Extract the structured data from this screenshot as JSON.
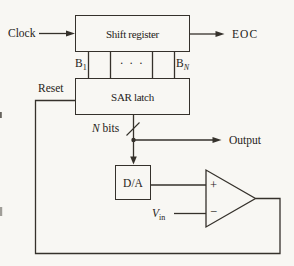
{
  "diagram": {
    "type": "block-diagram",
    "colors": {
      "paper": "#f8f7f3",
      "ink": "#35312b",
      "text": "#262319"
    },
    "blocks": {
      "shift_register": "Shift register",
      "sar_latch": "SAR latch",
      "dac": "D/A"
    },
    "labels": {
      "clock": "Clock",
      "eoc": "EOC",
      "reset": "Reset",
      "output": "Output",
      "dots": "· · ·",
      "b1_base": "B",
      "b1_sub": "1",
      "bn_base": "B",
      "bn_sub": "N",
      "nbits_n": "N",
      "nbits_rest": " bits",
      "vin_base": "V",
      "vin_sub": "in",
      "comparator_plus": "+",
      "comparator_minus": "−"
    }
  }
}
